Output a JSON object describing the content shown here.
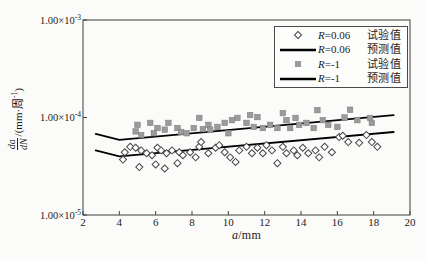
{
  "figure": {
    "background": "#fbfbf9",
    "frame_color": "#3f3f3f",
    "text_color": "#1c1c1c",
    "line_color": "#000000",
    "square_color": "#9b9b9b",
    "diamond_stroke": "#474747"
  },
  "axes": {
    "x_label_var": "a",
    "x_label_unit": "/mm",
    "y_label_frac_num": "da",
    "y_label_frac_den": "dN",
    "y_label_unit_pre": "/(mm·周",
    "y_label_unit_sup": "-1",
    "y_label_unit_post": ")"
  },
  "legend": {
    "rows": [
      {
        "marker": "open-diamond",
        "r_var": "R",
        "r_val": "=0.06",
        "label": "试验值"
      },
      {
        "marker": "line",
        "r_var": "R",
        "r_val": "=0.06",
        "label": "预测值"
      },
      {
        "marker": "filled-square",
        "r_var": "R",
        "r_val": "=-1",
        "label": "试验值"
      },
      {
        "marker": "line",
        "r_var": "R",
        "r_val": "=-1",
        "label": "预测值"
      }
    ]
  },
  "chart_data": {
    "type": "scatter",
    "title": "",
    "xlabel": "a/mm",
    "ylabel": "da/dN/(mm·周⁻¹)",
    "legend_position": "upper right",
    "grid": false,
    "x_axis": {
      "min": 2,
      "max": 20,
      "ticks": [
        2,
        4,
        6,
        8,
        10,
        12,
        14,
        16,
        18,
        20
      ]
    },
    "y_axis": {
      "scale": "log",
      "min": 1e-05,
      "max": 0.001,
      "ticks": [
        {
          "value": 0.001,
          "base": "1.00×10",
          "exp": "-3"
        },
        {
          "value": 0.0001,
          "base": "1.00×10",
          "exp": "-4"
        },
        {
          "value": 1e-05,
          "base": "1.00×10",
          "exp": "-5"
        }
      ]
    },
    "series": [
      {
        "name": "R=0.06 试验值",
        "kind": "scatter",
        "marker": "open-diamond",
        "color": "#474747",
        "points": [
          [
            4.2,
            3.7e-05
          ],
          [
            4.3,
            4.4e-05
          ],
          [
            4.6,
            5e-05
          ],
          [
            4.9,
            4.9e-05
          ],
          [
            5.1,
            3.1e-05
          ],
          [
            5.2,
            4.6e-05
          ],
          [
            5.5,
            4.3e-05
          ],
          [
            5.8,
            4.1e-05
          ],
          [
            6.0,
            3.3e-05
          ],
          [
            6.1,
            4.9e-05
          ],
          [
            6.3,
            4.6e-05
          ],
          [
            6.5,
            3e-05
          ],
          [
            6.6,
            4.3e-05
          ],
          [
            6.9,
            4.6e-05
          ],
          [
            7.2,
            3.4e-05
          ],
          [
            7.3,
            4.4e-05
          ],
          [
            7.5,
            4.1e-05
          ],
          [
            7.9,
            4.4e-05
          ],
          [
            8.2,
            3.9e-05
          ],
          [
            8.4,
            5e-05
          ],
          [
            8.5,
            5.6e-05
          ],
          [
            8.9,
            4.3e-05
          ],
          [
            9.3,
            4.9e-05
          ],
          [
            9.5,
            5.2e-05
          ],
          [
            9.8,
            4.4e-05
          ],
          [
            10.1,
            3.9e-05
          ],
          [
            10.4,
            3.5e-05
          ],
          [
            10.6,
            4.6e-05
          ],
          [
            11.0,
            5e-05
          ],
          [
            11.3,
            4.3e-05
          ],
          [
            11.6,
            4.9e-05
          ],
          [
            11.9,
            4.3e-05
          ],
          [
            12.1,
            5.2e-05
          ],
          [
            12.4,
            4.6e-05
          ],
          [
            12.7,
            3.4e-05
          ],
          [
            13.0,
            5e-05
          ],
          [
            13.2,
            4.3e-05
          ],
          [
            13.6,
            4.6e-05
          ],
          [
            13.8,
            4.1e-05
          ],
          [
            14.1,
            4.9e-05
          ],
          [
            14.4,
            4.3e-05
          ],
          [
            14.8,
            4.6e-05
          ],
          [
            15.0,
            3.9e-05
          ],
          [
            15.3,
            5e-05
          ],
          [
            15.7,
            4.4e-05
          ],
          [
            16.1,
            6.3e-05
          ],
          [
            16.3,
            6.5e-05
          ],
          [
            16.6,
            5.6e-05
          ],
          [
            17.2,
            5.5e-05
          ],
          [
            17.6,
            6.6e-05
          ],
          [
            17.9,
            5.6e-05
          ],
          [
            18.2,
            5e-05
          ]
        ]
      },
      {
        "name": "R=0.06 预测值",
        "kind": "line",
        "color": "#000000",
        "width": 1.8,
        "points": [
          [
            2.7,
            4.6e-05
          ],
          [
            4.0,
            4e-05
          ],
          [
            19.1,
            7.1e-05
          ]
        ]
      },
      {
        "name": "R=-1 试验值",
        "kind": "scatter",
        "marker": "filled-square",
        "color": "#9b9b9b",
        "points": [
          [
            4.9,
            7.2e-05
          ],
          [
            5.0,
            8.4e-05
          ],
          [
            5.2,
            6.6e-05
          ],
          [
            5.7,
            8.8e-05
          ],
          [
            5.9,
            6.9e-05
          ],
          [
            6.1,
            7.8e-05
          ],
          [
            6.5,
            7.5e-05
          ],
          [
            6.7,
            8.8e-05
          ],
          [
            7.2,
            7.8e-05
          ],
          [
            7.4,
            7.1e-05
          ],
          [
            7.7,
            6.9e-05
          ],
          [
            8.1,
            7.8e-05
          ],
          [
            8.4,
            9.9e-05
          ],
          [
            8.6,
            7.6e-05
          ],
          [
            8.9,
            8.4e-05
          ],
          [
            9.0,
            7.5e-05
          ],
          [
            9.4,
            8e-05
          ],
          [
            9.8,
            8.8e-05
          ],
          [
            10.0,
            6.9e-05
          ],
          [
            10.2,
            9.4e-05
          ],
          [
            10.5,
            9.9e-05
          ],
          [
            11.0,
            8.8e-05
          ],
          [
            11.2,
            0.000106
          ],
          [
            11.4,
            8e-05
          ],
          [
            11.6,
            0.000101
          ],
          [
            11.9,
            7.8e-05
          ],
          [
            12.3,
            8.4e-05
          ],
          [
            12.7,
            7.8e-05
          ],
          [
            13.0,
            0.000111
          ],
          [
            13.2,
            9.4e-05
          ],
          [
            13.4,
            7.8e-05
          ],
          [
            13.7,
            9.9e-05
          ],
          [
            13.9,
            8.4e-05
          ],
          [
            14.3,
            8.8e-05
          ],
          [
            14.7,
            7.8e-05
          ],
          [
            14.9,
            0.000119
          ],
          [
            15.2,
            9.4e-05
          ],
          [
            15.5,
            8.4e-05
          ],
          [
            16.0,
            8e-05
          ],
          [
            16.4,
            0.0001
          ],
          [
            16.7,
            0.00012
          ],
          [
            17.1,
            9.4e-05
          ],
          [
            17.8,
            9.9e-05
          ],
          [
            17.9,
            8.8e-05
          ]
        ]
      },
      {
        "name": "R=-1 预测值",
        "kind": "line",
        "color": "#000000",
        "width": 1.8,
        "points": [
          [
            2.7,
            6.8e-05
          ],
          [
            4.0,
            5.9e-05
          ],
          [
            19.1,
            0.000106
          ]
        ]
      }
    ]
  }
}
